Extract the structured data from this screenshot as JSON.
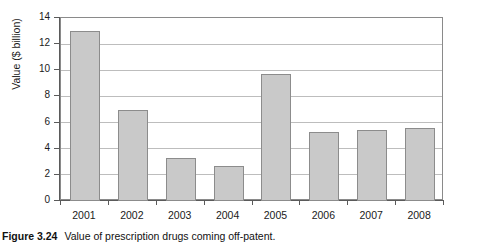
{
  "caption": {
    "label": "Figure 3.24",
    "text": "Value of prescription drugs coming off-patent."
  },
  "colors": {
    "bar_fill": "#c9c9c9",
    "bar_border": "#8c8c8c",
    "gridline": "#bdbdbd",
    "axis": "#5a5a5a",
    "text": "#1a1a1a",
    "background": "#ffffff"
  },
  "chart_data": {
    "type": "bar",
    "title": "",
    "subtitle": "",
    "xlabel": "",
    "ylabel": "Value ($ billion)",
    "categories": [
      "2001",
      "2002",
      "2003",
      "2004",
      "2005",
      "2006",
      "2007",
      "2008"
    ],
    "values": [
      13.0,
      6.95,
      3.3,
      2.65,
      9.7,
      5.25,
      5.4,
      5.6
    ],
    "series": [
      {
        "name": "Value of prescription drugs coming off-patent",
        "values": [
          13.0,
          6.95,
          3.3,
          2.65,
          9.7,
          5.25,
          5.4,
          5.6
        ]
      }
    ],
    "ylim": [
      0,
      14
    ],
    "ytick_interval": 2,
    "ytick_labels": [
      "0",
      "2",
      "4",
      "6",
      "8",
      "10",
      "12",
      "14"
    ],
    "xtick_labels": [
      "2001",
      "2002",
      "2003",
      "2004",
      "2005",
      "2006",
      "2007",
      "2008"
    ],
    "grid": true,
    "grid_axis": "y",
    "legend": false,
    "legend_position": "none",
    "annotations": []
  }
}
